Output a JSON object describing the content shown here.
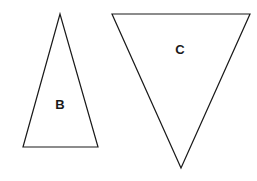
{
  "diagram": {
    "shapes": [
      {
        "id": "triangle-b",
        "label": "B",
        "orientation": "point-up",
        "points": "60,14 23,147 98,147",
        "label_pos": {
          "x": 60,
          "y": 109
        }
      },
      {
        "id": "triangle-c",
        "label": "C",
        "orientation": "point-down",
        "points": "112,14 250,14 181,168",
        "label_pos": {
          "x": 180,
          "y": 54
        }
      }
    ],
    "stroke_color": "#1a1a1a",
    "fill_color": "#ffffff"
  }
}
